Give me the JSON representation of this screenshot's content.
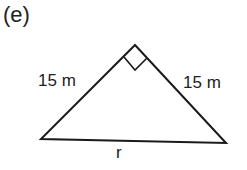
{
  "figure": {
    "part_label": "(e)",
    "shape": "right isosceles triangle",
    "sides": {
      "left": "15 m",
      "right": "15 m",
      "base": "r"
    },
    "right_angle_marker": true,
    "colors": {
      "stroke": "#1a1a1a",
      "background": "#ffffff"
    }
  }
}
